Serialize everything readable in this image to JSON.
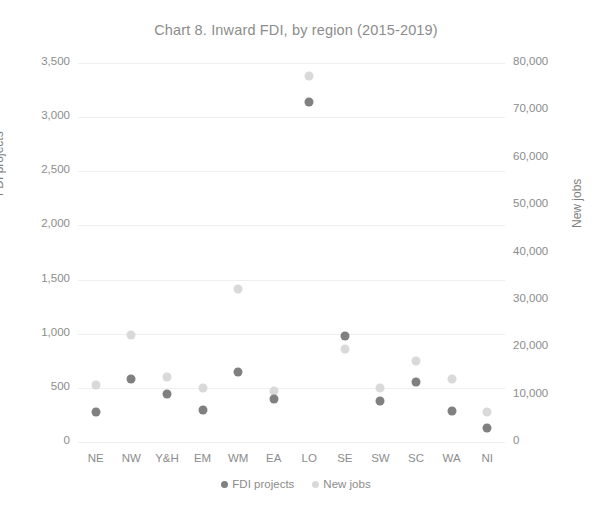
{
  "chart_data": {
    "type": "scatter",
    "title": "Chart 8. Inward FDI, by region (2015-2019)",
    "xlabel": "",
    "ylabel": "FDI projects",
    "y2label": "New jobs",
    "categories": [
      "NE",
      "NW",
      "Y&H",
      "EM",
      "WM",
      "EA",
      "LO",
      "SE",
      "SW",
      "SC",
      "WA",
      "NI"
    ],
    "ylim": [
      0,
      3500
    ],
    "y2lim": [
      0,
      80000
    ],
    "yticks": [
      "0",
      "500",
      "1,000",
      "1,500",
      "2,000",
      "2,500",
      "3,000",
      "3,500"
    ],
    "ytick_values": [
      0,
      500,
      1000,
      1500,
      2000,
      2500,
      3000,
      3500
    ],
    "y2ticks": [
      "0",
      "10,000",
      "20,000",
      "30,000",
      "40,000",
      "50,000",
      "60,000",
      "70,000",
      "80,000"
    ],
    "y2tick_values": [
      0,
      10000,
      20000,
      30000,
      40000,
      50000,
      60000,
      70000,
      80000
    ],
    "grid": true,
    "legend_position": "bottom",
    "series": [
      {
        "name": "FDI projects",
        "axis": "left",
        "color": "#808080",
        "values": [
          280,
          585,
          445,
          295,
          645,
          400,
          3140,
          975,
          375,
          555,
          290,
          130
        ]
      },
      {
        "name": "New jobs",
        "axis": "right",
        "color": "#d9d9d9",
        "values": [
          12100,
          22600,
          13800,
          11300,
          32400,
          10700,
          77200,
          19600,
          11400,
          17100,
          13200,
          6400
        ]
      }
    ]
  },
  "legend": {
    "items": [
      {
        "label": "FDI projects",
        "color": "#808080"
      },
      {
        "label": "New jobs",
        "color": "#d9d9d9"
      }
    ]
  }
}
